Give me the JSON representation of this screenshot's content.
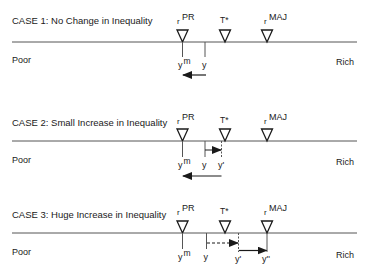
{
  "cases": [
    {
      "title": "CASE 1: No Change in Inequality",
      "left_label": "Poor",
      "right_label": "Rich",
      "axis_y": 42,
      "markers": {
        "rPR": {
          "base": "r",
          "sup": "PR"
        },
        "Tstar": "T*",
        "rMAJ": {
          "base": "r",
          "sup": "MAJ"
        }
      },
      "points": [
        {
          "base": "y",
          "sup": "m"
        },
        {
          "base": "y",
          "sup": ""
        }
      ]
    },
    {
      "title": "CASE 2: Small Increase in Inequality",
      "left_label": "Poor",
      "right_label": "Rich",
      "axis_y": 141,
      "markers": {
        "rPR": {
          "base": "r",
          "sup": "PR"
        },
        "Tstar": "T*",
        "rMAJ": {
          "base": "r",
          "sup": "MAJ"
        }
      },
      "points": [
        {
          "base": "y",
          "sup": "m"
        },
        {
          "base": "y",
          "sup": ""
        },
        {
          "base": "y'",
          "sup": ""
        }
      ]
    },
    {
      "title": "CASE 3: Huge Increase in Inequality",
      "left_label": "Poor",
      "right_label": "Rich",
      "axis_y": 233,
      "markers": {
        "rPR": {
          "base": "r",
          "sup": "PR"
        },
        "Tstar": "T*",
        "rMAJ": {
          "base": "r",
          "sup": "MAJ"
        }
      },
      "points": [
        {
          "base": "y",
          "sup": "m"
        },
        {
          "base": "y",
          "sup": ""
        },
        {
          "base": "y'",
          "sup": ""
        },
        {
          "base": "y''",
          "sup": ""
        }
      ]
    }
  ],
  "colors": {
    "ink": "#1a1a1a",
    "line": "#555555"
  }
}
